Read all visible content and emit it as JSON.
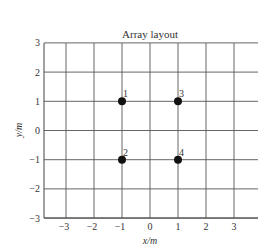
{
  "chart_data": {
    "type": "scatter",
    "title": "Array layout",
    "xlabel": "x/m",
    "ylabel": "y/m",
    "xlim": [
      -3.8,
      3.8
    ],
    "ylim": [
      -3,
      3
    ],
    "grid": true,
    "xticks": [
      -3,
      -2,
      -1,
      0,
      1,
      2,
      3
    ],
    "yticks": [
      -3,
      -2,
      -1,
      0,
      1,
      2,
      3
    ],
    "xtick_labels": [
      "−3",
      "−2",
      "−1",
      "0",
      "1",
      "2",
      "3"
    ],
    "ytick_labels": [
      "−3",
      "−2",
      "−1",
      "0",
      "1",
      "2",
      "3"
    ],
    "points": [
      {
        "label": "1",
        "x": -1,
        "y": 1
      },
      {
        "label": "2",
        "x": -1,
        "y": -1
      },
      {
        "label": "3",
        "x": 1,
        "y": 1
      },
      {
        "label": "4",
        "x": 1,
        "y": -1
      }
    ]
  }
}
